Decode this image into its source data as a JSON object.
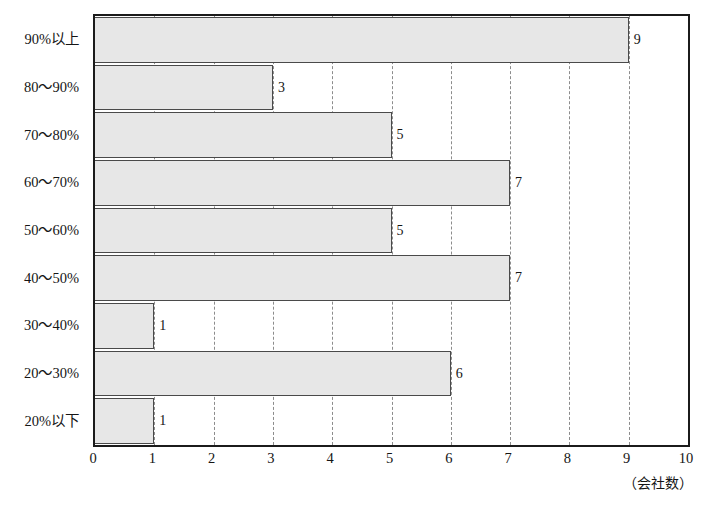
{
  "chart_data": {
    "type": "bar",
    "orientation": "horizontal",
    "title": "",
    "subtitle": "",
    "xlabel": "",
    "ylabel": "",
    "unit_caption": "（会社数）",
    "categories": [
      "90%以上",
      "80〜90%",
      "70〜80%",
      "60〜70%",
      "50〜60%",
      "40〜50%",
      "30〜40%",
      "20〜30%",
      "20%以下"
    ],
    "values": [
      9,
      3,
      5,
      7,
      5,
      7,
      1,
      6,
      1
    ],
    "data_labels": [
      "9",
      "3",
      "5",
      "7",
      "5",
      "7",
      "1",
      "6",
      "1"
    ],
    "xlim": [
      0,
      10
    ],
    "xticks": [
      0,
      1,
      2,
      3,
      4,
      5,
      6,
      7,
      8,
      9,
      10
    ],
    "xtick_labels": [
      "0",
      "1",
      "2",
      "3",
      "4",
      "5",
      "6",
      "7",
      "8",
      "9",
      "10"
    ],
    "grid": true,
    "grid_axis": "x",
    "grid_style": "dashed",
    "legend": false,
    "legend_position": "none",
    "colors": {
      "bar_fill": "#e7e7e7",
      "bar_border": "#4a4a4a",
      "frame": "#1b1b1b",
      "gridline": "#8c8c8c",
      "text": "#151515",
      "background": "#ffffff"
    }
  }
}
